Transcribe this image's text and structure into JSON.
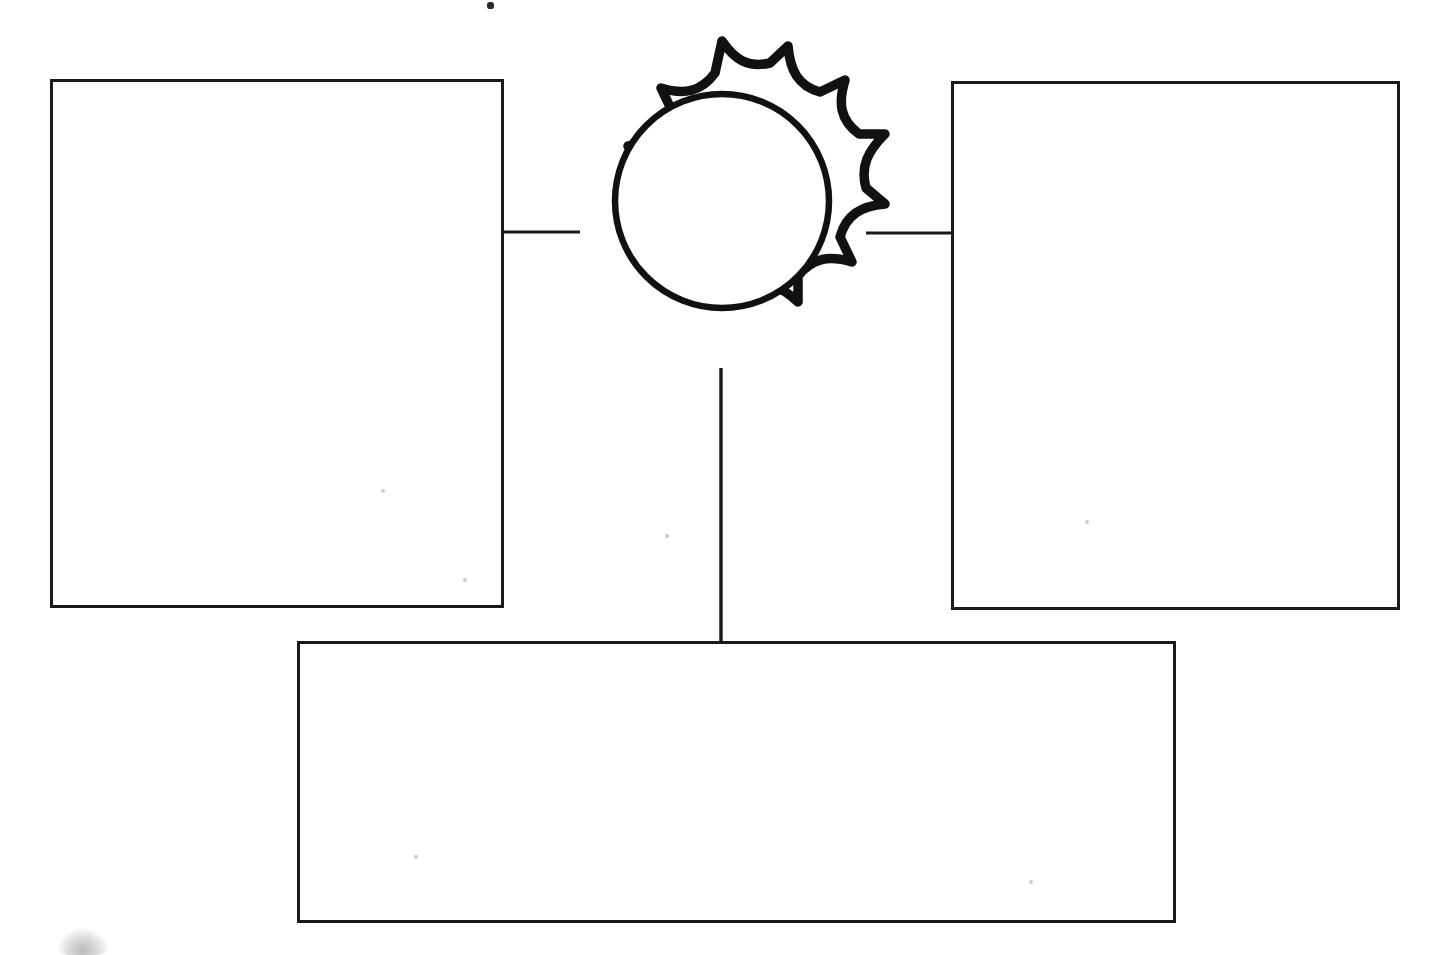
{
  "document": {
    "title": "Blank Graphic Organizer Worksheet",
    "type": "diagram",
    "page_background": "#ffffff",
    "ink_color": "#1a1a1a",
    "width": 1441,
    "height": 955,
    "description": "Scanned blank graphic organizer: a central sun burst shape with a plain inner circle, connected by straight line segments to three empty rectangular text boxes (left, right and bottom). All boxes are blank with no written text."
  },
  "center_node": {
    "name": "sun-burst-node",
    "shape": "sun",
    "label": "",
    "points": 10,
    "center_x": 722,
    "center_y": 201,
    "outer_radius": 164,
    "inner_circle_radius": 107,
    "stroke_width": 9,
    "inner_stroke_width": 6,
    "stroke_color": "#111111",
    "fill": "#ffffff"
  },
  "boxes": [
    {
      "name": "left-box",
      "label": "",
      "placeholder": "",
      "x": 50,
      "y": 79,
      "width": 454,
      "height": 529,
      "stroke_width": 3,
      "stroke_color": "#1a1a1a",
      "fill": "#ffffff"
    },
    {
      "name": "right-box",
      "label": "",
      "placeholder": "",
      "x": 951,
      "y": 81,
      "width": 449,
      "height": 529,
      "stroke_width": 3,
      "stroke_color": "#1a1a1a",
      "fill": "#ffffff"
    },
    {
      "name": "bottom-box",
      "label": "",
      "placeholder": "",
      "x": 297,
      "y": 641,
      "width": 879,
      "height": 282,
      "stroke_width": 3,
      "stroke_color": "#1a1a1a",
      "fill": "#ffffff"
    }
  ],
  "connectors": [
    {
      "name": "connector-left",
      "orientation": "horizontal",
      "x1": 504,
      "y1": 232,
      "x2": 578,
      "y2": 232,
      "stroke_width": 3,
      "stroke_color": "#1a1a1a"
    },
    {
      "name": "connector-right",
      "orientation": "horizontal",
      "x1": 869,
      "y1": 233,
      "x2": 951,
      "y2": 233,
      "stroke_width": 3,
      "stroke_color": "#1a1a1a"
    },
    {
      "name": "connector-bottom",
      "orientation": "vertical",
      "x1": 721,
      "y1": 372,
      "x2": 721,
      "y2": 643,
      "stroke_width": 3,
      "stroke_color": "#1a1a1a"
    }
  ],
  "scan_artifacts": [
    {
      "name": "speck-top",
      "x": 487,
      "y": 2,
      "width": 7,
      "height": 7,
      "kind": "ink-speck"
    },
    {
      "name": "smudge-bottom-left",
      "x": 57,
      "y": 930,
      "width": 50,
      "height": 24,
      "kind": "gray-smudge"
    },
    {
      "name": "faint-dot-left-box",
      "x": 381,
      "y": 489,
      "width": 4,
      "height": 4,
      "kind": "faint-dot"
    },
    {
      "name": "faint-dot-left-box-2",
      "x": 463,
      "y": 578,
      "width": 4,
      "height": 4,
      "kind": "faint-dot"
    },
    {
      "name": "faint-dot-center",
      "x": 665,
      "y": 534,
      "width": 4,
      "height": 4,
      "kind": "faint-dot"
    },
    {
      "name": "faint-dot-right-box",
      "x": 1085,
      "y": 520,
      "width": 4,
      "height": 4,
      "kind": "faint-dot"
    },
    {
      "name": "faint-dot-bottom-box",
      "x": 414,
      "y": 855,
      "width": 4,
      "height": 4,
      "kind": "faint-dot"
    },
    {
      "name": "faint-dot-bottom-box-2",
      "x": 1029,
      "y": 880,
      "width": 4,
      "height": 4,
      "kind": "faint-dot"
    }
  ]
}
